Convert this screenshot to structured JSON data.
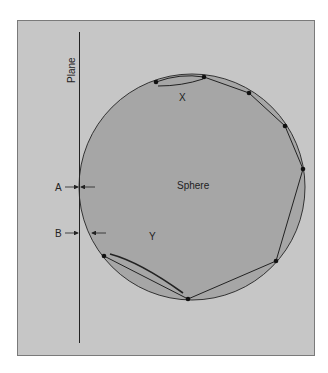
{
  "labels": {
    "plane": "Plane",
    "sphere": "Sphere",
    "x": "X",
    "y": "Y",
    "a": "A",
    "b": "B"
  },
  "colors": {
    "background": "#ffffff",
    "frame_fill": "#c6c6c6",
    "frame_border": "#7a7a7a",
    "sphere_fill": "#a6a6a6",
    "line": "#222222"
  },
  "geometry": {
    "frame": {
      "x": 17,
      "y": 20,
      "w": 298,
      "h": 336
    },
    "plane_line": {
      "x": 79,
      "y1": 32,
      "y2": 343
    },
    "sphere": {
      "cx": 192,
      "cy": 187,
      "r": 113
    },
    "points": [
      {
        "x": 156,
        "y": 82
      },
      {
        "x": 204,
        "y": 77
      },
      {
        "x": 249,
        "y": 93
      },
      {
        "x": 285,
        "y": 126
      },
      {
        "x": 303,
        "y": 169
      },
      {
        "x": 276,
        "y": 261
      },
      {
        "x": 188,
        "y": 299
      },
      {
        "x": 104,
        "y": 256
      }
    ]
  }
}
